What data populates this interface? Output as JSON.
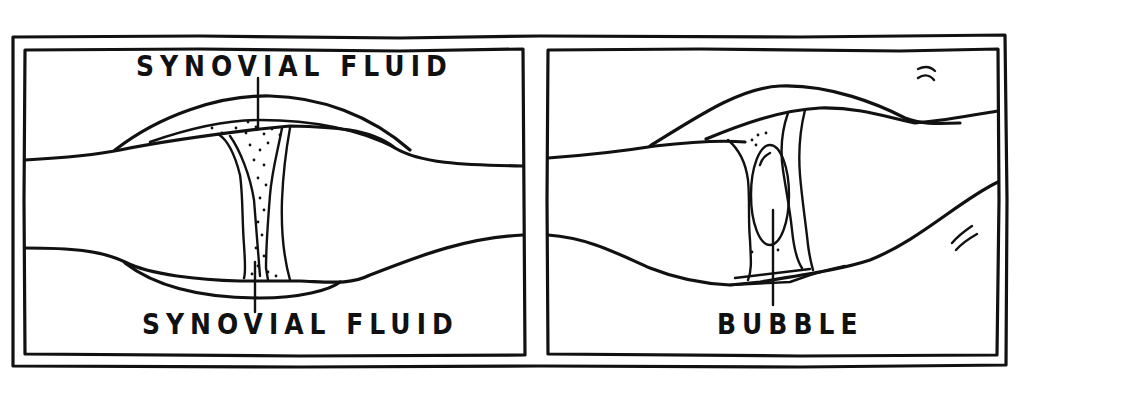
{
  "figure": {
    "panels": [
      {
        "id": "left",
        "state": "normal joint with synovial fluid",
        "labels": {
          "top": "SYNOVIAL FLUID",
          "bottom": "SYNOVIAL FLUID"
        }
      },
      {
        "id": "right",
        "state": "joint distracted with gas bubble",
        "labels": {
          "bottom": "BUBBLE"
        },
        "motion_marks": [
          "upper-right tick marks",
          "lower-right tick marks"
        ]
      }
    ],
    "colors": {
      "ink": "#111111",
      "background": "#ffffff"
    }
  }
}
